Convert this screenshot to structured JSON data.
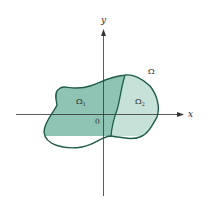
{
  "diagram": {
    "axes": {
      "x_label": "x",
      "y_label": "y",
      "origin_label": "0"
    },
    "regions": {
      "whole_label": "Ω",
      "sub1_label": "Ω",
      "sub1_subscript": "1",
      "sub2_label": "Ω",
      "sub2_subscript": "2"
    },
    "colors": {
      "region1_fill": "#8fc4b4",
      "region2_fill": "#c6e2d8",
      "outline": "#1f5c4a",
      "axis": "#333333"
    }
  }
}
